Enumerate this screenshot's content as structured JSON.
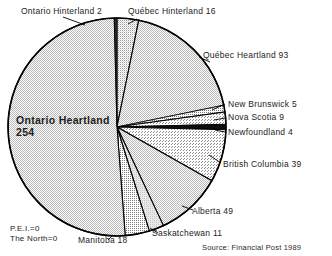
{
  "chart_data": {
    "type": "pie",
    "title": "",
    "units": "",
    "total": 500,
    "start_angle_deg": 0,
    "direction": "clockwise",
    "categories": [
      "Québec Hinterland",
      "Québec Heartland",
      "New Brunswick",
      "Nova Scotia",
      "Newfoundland",
      "British Columbia",
      "Alberta",
      "Saskatchewan",
      "Manitoba",
      "Ontario Heartland",
      "Ontario Hinterland"
    ],
    "values": [
      16,
      93,
      5,
      9,
      4,
      39,
      49,
      11,
      18,
      254,
      2
    ],
    "zero_categories": [
      "P.E.I.",
      "The North"
    ],
    "zero_values": [
      0,
      0
    ],
    "legend": "labels-outside",
    "grid": false
  },
  "labels": {
    "ontario_hinterland": "Ontario Hinterland 2",
    "quebec_hinterland": "Québec Hinterland 16",
    "quebec_heartland": "Québec Heartland 93",
    "new_brunswick": "New Brunswick 5",
    "nova_scotia": "Nova Scotia 9",
    "newfoundland": "Newfoundland 4",
    "british_columbia": "British Columbia 39",
    "alberta": "Alberta 49",
    "saskatchewan": "Saskatchewan 11",
    "manitoba": "Manitoba 18",
    "ontario_heartland_name": "Ontario  Heartland",
    "ontario_heartland_value": "254",
    "pei": "P.E.I.=0",
    "the_north": "The North=0"
  },
  "footer": {
    "source": "Source: Financial Post 1989"
  },
  "colors": {
    "outline": "#000000",
    "ontario_heartland": "#d2d2d2",
    "ontario_hinterland": "#2b2b2b",
    "quebec_hinterland": "#9e9e9e",
    "quebec_heartland": "#cfcfcf",
    "new_brunswick": "#5a5a5a",
    "nova_scotia": "#8a8a8a",
    "newfoundland": "#111111",
    "british_columbia": "#a6a6a6",
    "alberta": "#c9c9c9",
    "saskatchewan": "#e2e2e2",
    "manitoba": "#9a9a9a",
    "background": "#ffffff"
  }
}
